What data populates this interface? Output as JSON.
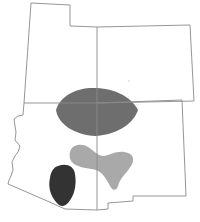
{
  "map": {
    "title": "",
    "region": "Four Corners states",
    "states": [
      {
        "name": "Utah",
        "position": "northwest"
      },
      {
        "name": "Colorado",
        "position": "northeast"
      },
      {
        "name": "Arizona",
        "position": "southwest"
      },
      {
        "name": "New Mexico",
        "position": "southeast"
      }
    ],
    "shaded_regions": [
      {
        "id": "region-dark-gray",
        "shade": "dark gray",
        "color": "#6e6e6e",
        "location": "straddles four corners point"
      },
      {
        "id": "region-light-gray",
        "shade": "light gray",
        "color": "#a9a9a9",
        "location": "central Arizona / western New Mexico, Y-shaped"
      },
      {
        "id": "region-black",
        "shade": "near black",
        "color": "#333333",
        "location": "southern Arizona"
      }
    ],
    "colors": {
      "background": "#ffffff",
      "border": "#8a8a8a",
      "dark": "#6e6e6e",
      "light": "#a9a9a9",
      "black": "#333333"
    }
  }
}
